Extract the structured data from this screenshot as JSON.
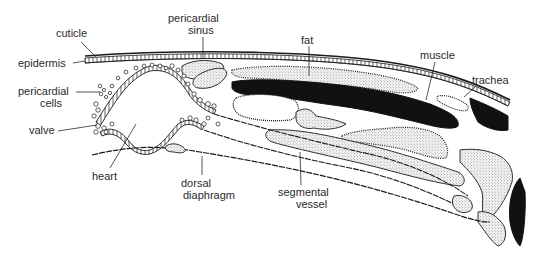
{
  "figure": {
    "colors": {
      "ink": "#1a1a1a",
      "muscle_fill": "#111111",
      "background": "#ffffff"
    }
  },
  "labels": {
    "cuticle": "cuticle",
    "epidermis": "epidermis",
    "pericardial_cells_line1": "pericardial",
    "pericardial_cells_line2": "cells",
    "valve": "valve",
    "heart": "heart",
    "pericardial_sinus_line1": "pericardial",
    "pericardial_sinus_line2": "sinus",
    "fat": "fat",
    "muscle": "muscle",
    "trachea": "trachea",
    "dorsal_diaphragm_line1": "dorsal",
    "dorsal_diaphragm_line2": "diaphragm",
    "segmental_vessel_line1": "segmental",
    "segmental_vessel_line2": "vessel"
  }
}
